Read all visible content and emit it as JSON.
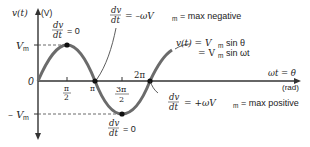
{
  "axes": {
    "y_label": "v(t)",
    "y_unit": "(V)",
    "x_label": "ωt = θ",
    "x_unit": "(rad)",
    "origin": "0",
    "vm_label": "V",
    "vm_sub": "m",
    "neg_vm_label": "– V",
    "neg_vm_sub": "m"
  },
  "x_ticks": {
    "pi_over_2_num": "π",
    "pi_over_2_den": "2",
    "pi": "π",
    "three_pi_over_2_num": "3π",
    "three_pi_over_2_den": "2",
    "two_pi": "2π"
  },
  "annotations": {
    "max_point": {
      "num": "dv",
      "den": "dt",
      "rest": "= 0"
    },
    "min_point": {
      "num": "dv",
      "den": "dt",
      "rest": "= 0"
    },
    "pi_point": {
      "num": "dv",
      "den": "dt",
      "rest": "= –ωV",
      "sub": "m",
      "tail": "= max negative"
    },
    "two_pi_point": {
      "num": "dv",
      "den": "dt",
      "rest": "= +ωV",
      "sub": "m",
      "tail": "= max positive"
    },
    "equation_line1": "v(t) = V",
    "equation_line1_sub": "m",
    "equation_line1_tail": "sin θ",
    "equation_line2": "= V",
    "equation_line2_sub": "m",
    "equation_line2_tail": "sin ωt"
  },
  "colors": {
    "curve": "#6b6b6b",
    "axes": "#333333",
    "dots": "#111111"
  }
}
